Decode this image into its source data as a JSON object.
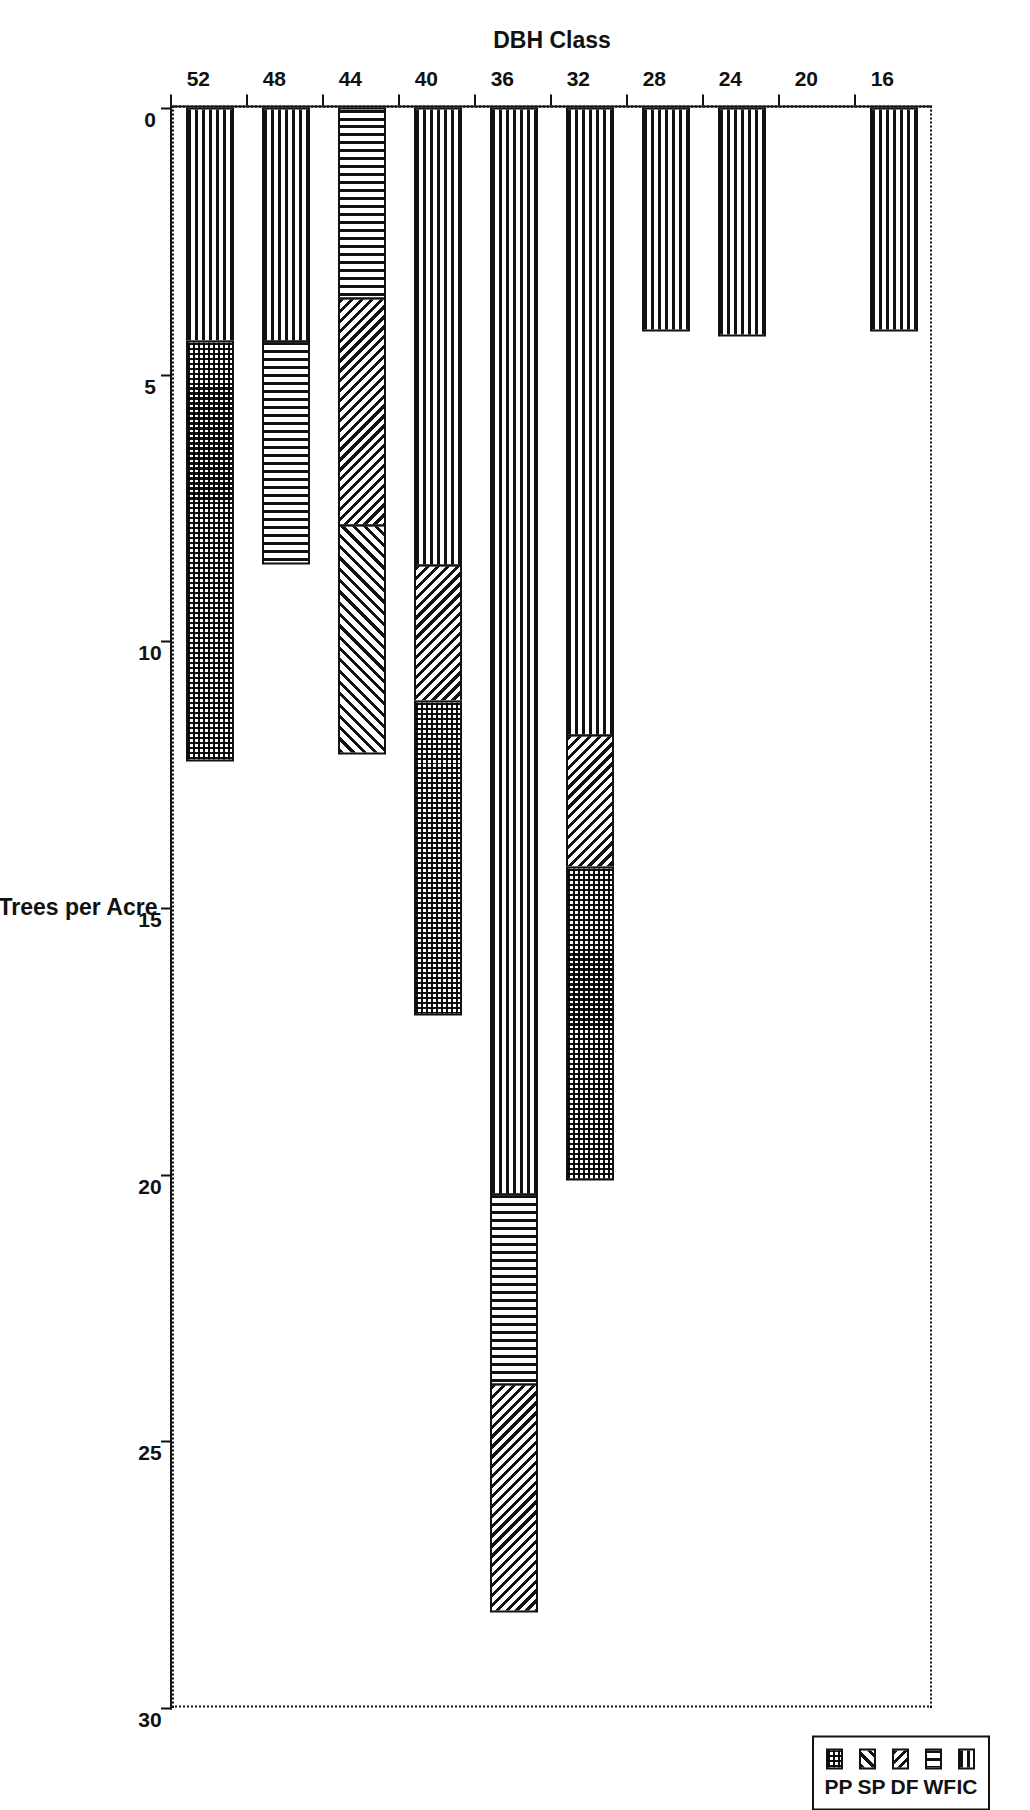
{
  "chart_data": {
    "type": "bar",
    "orientation": "vertical-stacked",
    "title": "",
    "xlabel": "DBH Class",
    "ylabel": "Trees per Acre",
    "categories": [
      "16",
      "20",
      "24",
      "28",
      "32",
      "36",
      "40",
      "44",
      "48",
      "52"
    ],
    "ylim": [
      0,
      30
    ],
    "yticks": [
      "0",
      "5",
      "10",
      "15",
      "20",
      "25",
      "30"
    ],
    "grid": false,
    "legend_position": "top-right",
    "series": [
      {
        "name": "IC",
        "pattern": "horizontal-lines",
        "values": [
          4.2,
          0,
          4.3,
          4.2,
          11.8,
          20.4,
          8.6,
          0,
          4.4,
          4.4
        ]
      },
      {
        "name": "WF",
        "pattern": "vertical-lines",
        "values": [
          0,
          0,
          0,
          0,
          0,
          3.6,
          0,
          3.6,
          4.2,
          0
        ]
      },
      {
        "name": "DF",
        "pattern": "diagonal-hatch",
        "values": [
          0,
          0,
          0,
          0,
          2.5,
          4.3,
          2.6,
          4.3,
          0,
          0
        ]
      },
      {
        "name": "SP",
        "pattern": "reverse-diagonal-hatch",
        "values": [
          0,
          0,
          0,
          0,
          0,
          0,
          0,
          4.3,
          0,
          0
        ]
      },
      {
        "name": "PP",
        "pattern": "dotted-checker",
        "values": [
          0,
          0,
          0,
          0,
          5.9,
          0,
          5.9,
          0,
          0,
          7.9
        ]
      }
    ],
    "totals": [
      4.2,
      0,
      4.3,
      4.2,
      20.2,
      28.3,
      17.1,
      12.2,
      8.6,
      12.3
    ]
  },
  "axes": {
    "value_axis_title": "Trees per Acre",
    "category_axis_title": "DBH Class"
  },
  "legend": {
    "items": [
      {
        "label": "IC"
      },
      {
        "label": "WF"
      },
      {
        "label": "DF"
      },
      {
        "label": "SP"
      },
      {
        "label": "PP"
      }
    ]
  }
}
